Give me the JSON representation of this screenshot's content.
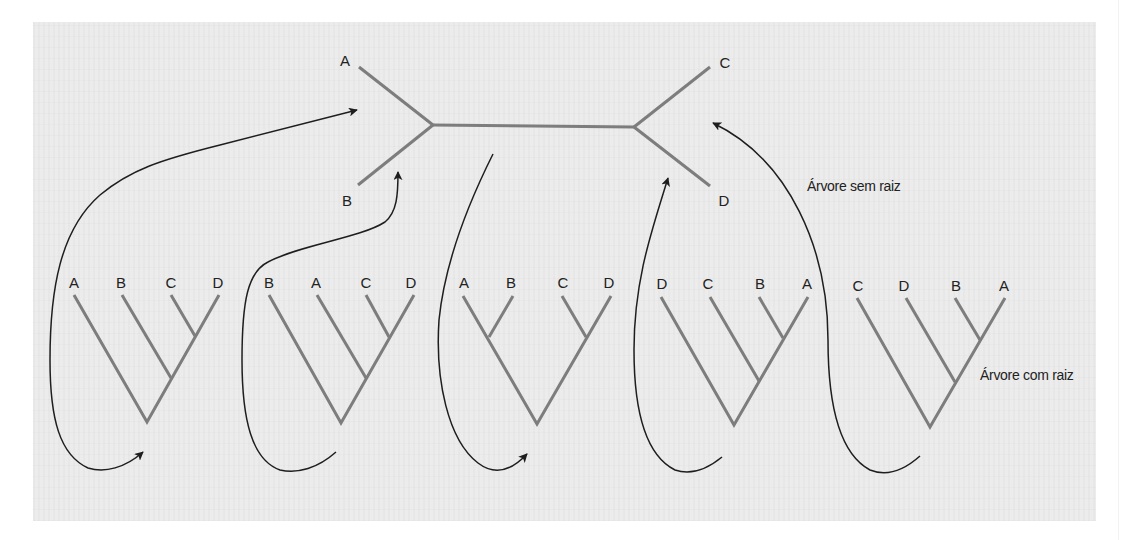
{
  "unrooted_tree": {
    "caption": "Árvore sem raiz",
    "leaves": [
      {
        "label": "A",
        "x": 345,
        "y": 65
      },
      {
        "label": "B",
        "x": 347,
        "y": 205
      },
      {
        "label": "C",
        "x": 725,
        "y": 67
      },
      {
        "label": "D",
        "x": 724,
        "y": 205
      }
    ],
    "branch_color": "#7d7d7d"
  },
  "rooted_trees": {
    "caption": "Árvore com raiz",
    "trees": [
      {
        "leaves": [
          "A",
          "B",
          "C",
          "D"
        ],
        "topology": "(A,(B,(C,D)))"
      },
      {
        "leaves": [
          "B",
          "A",
          "C",
          "D"
        ],
        "topology": "(B,(A,(C,D)))"
      },
      {
        "leaves": [
          "A",
          "B",
          "C",
          "D"
        ],
        "topology": "((A,B),(C,D))"
      },
      {
        "leaves": [
          "D",
          "C",
          "B",
          "A"
        ],
        "topology": "(D,(C,(B,A)))"
      },
      {
        "leaves": [
          "C",
          "D",
          "B",
          "A"
        ],
        "topology": "(C,(D,(B,A)))"
      }
    ]
  },
  "colors": {
    "panel_background": "#ececec",
    "branch": "#7d7d7d",
    "arrow": "#1e1e1e",
    "text": "#222222"
  }
}
